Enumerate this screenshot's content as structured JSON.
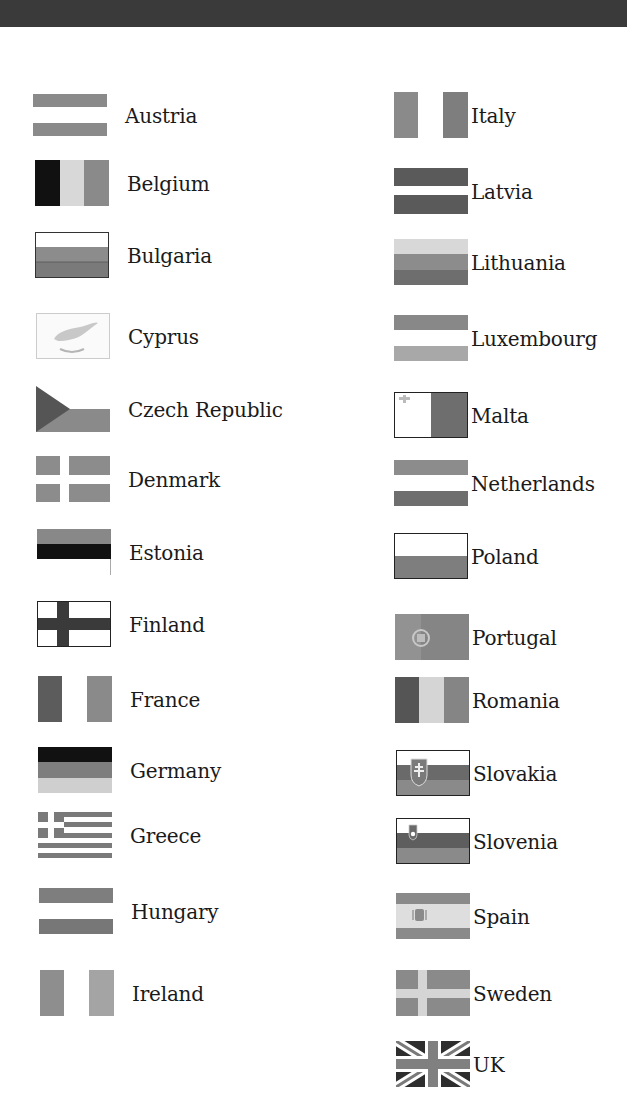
{
  "header": {
    "band_color": "#3a3a3a"
  },
  "palette": {
    "black": "#111111",
    "dark": "#595959",
    "mid": "#7d7d7d",
    "light": "#a3a3a3",
    "pale": "#d4d4d4",
    "white": "#ffffff"
  },
  "left_column": [
    {
      "country": "Austria",
      "flag_icon": "austria-flag-icon"
    },
    {
      "country": "Belgium",
      "flag_icon": "belgium-flag-icon"
    },
    {
      "country": "Bulgaria",
      "flag_icon": "bulgaria-flag-icon"
    },
    {
      "country": "Cyprus",
      "flag_icon": "cyprus-flag-icon"
    },
    {
      "country": "Czech Republic",
      "flag_icon": "czech-republic-flag-icon"
    },
    {
      "country": "Denmark",
      "flag_icon": "denmark-flag-icon"
    },
    {
      "country": "Estonia",
      "flag_icon": "estonia-flag-icon"
    },
    {
      "country": "Finland",
      "flag_icon": "finland-flag-icon"
    },
    {
      "country": "France",
      "flag_icon": "france-flag-icon"
    },
    {
      "country": "Germany",
      "flag_icon": "germany-flag-icon"
    },
    {
      "country": "Greece",
      "flag_icon": "greece-flag-icon"
    },
    {
      "country": "Hungary",
      "flag_icon": "hungary-flag-icon"
    },
    {
      "country": "Ireland",
      "flag_icon": "ireland-flag-icon"
    }
  ],
  "right_column": [
    {
      "country": "Italy",
      "flag_icon": "italy-flag-icon"
    },
    {
      "country": "Latvia",
      "flag_icon": "latvia-flag-icon"
    },
    {
      "country": "Lithuania",
      "flag_icon": "lithuania-flag-icon"
    },
    {
      "country": "Luxembourg",
      "flag_icon": "luxembourg-flag-icon"
    },
    {
      "country": "Malta",
      "flag_icon": "malta-flag-icon"
    },
    {
      "country": "Netherlands",
      "flag_icon": "netherlands-flag-icon"
    },
    {
      "country": "Poland",
      "flag_icon": "poland-flag-icon"
    },
    {
      "country": "Portugal",
      "flag_icon": "portugal-flag-icon"
    },
    {
      "country": "Romania",
      "flag_icon": "romania-flag-icon"
    },
    {
      "country": "Slovakia",
      "flag_icon": "slovakia-flag-icon"
    },
    {
      "country": "Slovenia",
      "flag_icon": "slovenia-flag-icon"
    },
    {
      "country": "Spain",
      "flag_icon": "spain-flag-icon"
    },
    {
      "country": "Sweden",
      "flag_icon": "sweden-flag-icon"
    },
    {
      "country": "UK",
      "flag_icon": "uk-flag-icon"
    }
  ]
}
